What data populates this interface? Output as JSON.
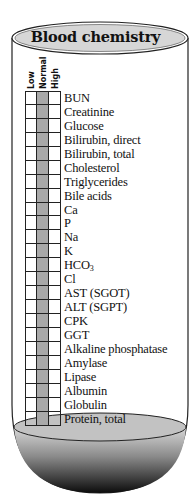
{
  "title": "Blood chemistry",
  "columns": [
    "Low",
    "Normal",
    "High"
  ],
  "highlighted_column": "Normal",
  "colors": {
    "normal_fill": "#a9a9a9",
    "outline": "#222222",
    "liquid_top": "#c4c4c4",
    "liquid_dark": "#111111"
  },
  "analytes": [
    "BUN",
    "Creatinine",
    "Glucose",
    "Bilirubin, direct",
    "Bilirubin, total",
    "Cholesterol",
    "Triglycerides",
    "Bile acids",
    "Ca",
    "P",
    "Na",
    "K",
    "HCO3",
    "Cl",
    "AST (SGOT)",
    "ALT (SGPT)",
    "CPK",
    "GGT",
    "Alkaline phosphatase",
    "Amylase",
    "Lipase",
    "Albumin",
    "Globulin",
    "Protein, total"
  ]
}
